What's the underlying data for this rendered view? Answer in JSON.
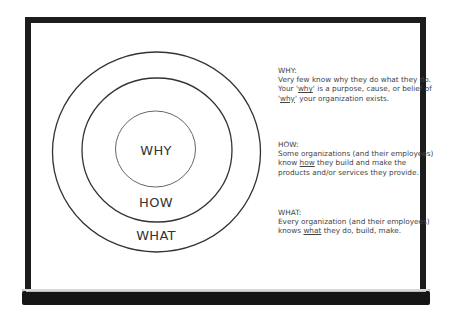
{
  "diagram": {
    "type": "golden-circle",
    "circles": [
      {
        "label": "WHY",
        "level": "inner"
      },
      {
        "label": "HOW",
        "level": "middle"
      },
      {
        "label": "WHAT",
        "level": "outer"
      }
    ],
    "colors": {
      "frame": "#1c1c1c",
      "stroke": "#333333",
      "text": "#444444",
      "background": "#ffffff"
    }
  },
  "descriptions": {
    "why": {
      "heading": "WHY:",
      "text_before": "Very few know why they do what they do. Your '",
      "emph1": "why",
      "text_mid": "' is a purpose, cause, or belief of '",
      "emph2": "why",
      "text_after": "' your organization exists."
    },
    "how": {
      "heading": "HOW:",
      "text_before": "Some organizations (and their employees) know ",
      "emph": "how",
      "text_after": " they build and make the products and/or services they provide."
    },
    "what": {
      "heading": "WHAT:",
      "text_before": "Every organization (and their employees) knows ",
      "emph": "what",
      "text_after": " they do, build, make."
    }
  }
}
